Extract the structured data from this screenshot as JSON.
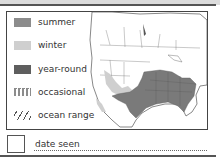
{
  "legend": {
    "items": [
      {
        "label": "summer",
        "color": "#8c8c8c",
        "pattern": "solid"
      },
      {
        "label": "winter",
        "color": "#cfcfcf",
        "pattern": "solid"
      },
      {
        "label": "year-round",
        "color": "#5e5e5e",
        "pattern": "solid"
      },
      {
        "label": "occasional",
        "color": "#8c8c8c",
        "pattern": "dotted"
      },
      {
        "label": "ocean range",
        "color": "#555555",
        "pattern": "hatch"
      }
    ]
  },
  "map": {
    "region": "North America",
    "year_round_color": "#7a7a7a",
    "winter_color": "#cfcfcf"
  },
  "checklist": {
    "date_label": "date seen"
  }
}
